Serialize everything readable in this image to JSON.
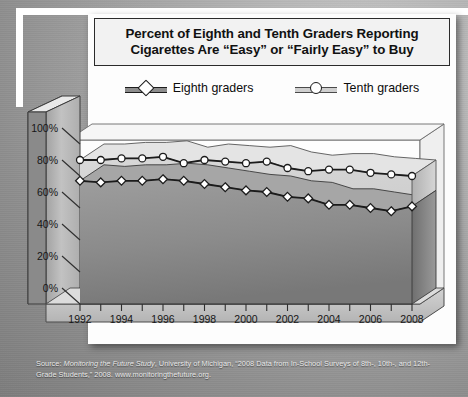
{
  "title": "Percent of Eighth and Tenth Graders Reporting Cigarettes Are “Easy” or “Fairly Easy” to Buy",
  "legend": {
    "eighth": "Eighth graders",
    "tenth": "Tenth graders"
  },
  "source": {
    "prefix": "Source: ",
    "italic": "Monitoring the Future Study",
    "rest": ", University of Michigan, “2008 Data from In-School Surveys of 8th-, 10th-, and 12th-Grade Students,” 2008. www.monitoringthefuture.org."
  },
  "colors": {
    "eighth_fill": "#8d8d8d",
    "tenth_fill": "#cfcfcf",
    "line": "#1b1b1b",
    "marker_fill": "#ffffff",
    "wall": "#b9b9b9",
    "floor": "#c4c4c4",
    "card": "#fdfdfd",
    "frame": "#ffffff",
    "background": "#9a9a9a"
  },
  "chart_data": {
    "type": "area",
    "title": "Percent of Eighth and Tenth Graders Reporting Cigarettes Are “Easy” or “Fairly Easy” to Buy",
    "xlabel": "",
    "ylabel": "",
    "ylim": [
      0,
      100
    ],
    "ytick_labels": [
      "0%",
      "20%",
      "40%",
      "60%",
      "80%",
      "100%"
    ],
    "ytick_values": [
      0,
      20,
      40,
      60,
      80,
      100
    ],
    "grid": false,
    "legend_position": "top",
    "x": [
      1992,
      1993,
      1994,
      1995,
      1996,
      1997,
      1998,
      1999,
      2000,
      2001,
      2002,
      2003,
      2004,
      2005,
      2006,
      2007,
      2008
    ],
    "xtick_labels": [
      "1992",
      "",
      "1994",
      "",
      "1996",
      "",
      "1998",
      "",
      "2000",
      "",
      "2002",
      "",
      "2004",
      "",
      "2006",
      "",
      "2008"
    ],
    "xtick_labels_shown": [
      "1992",
      "1994",
      "1996",
      "1998",
      "2000",
      "2002",
      "2004",
      "2006",
      "2008"
    ],
    "series": [
      {
        "name": "Tenth graders",
        "marker": "circle",
        "values": [
          90,
          90,
          91,
          91,
          92,
          88,
          90,
          89,
          88,
          89,
          85,
          83,
          84,
          84,
          82,
          81,
          80
        ]
      },
      {
        "name": "Eighth graders",
        "marker": "diamond",
        "values": [
          77,
          76,
          77,
          77,
          78,
          77,
          75,
          73,
          71,
          70,
          67,
          66,
          62,
          62,
          60,
          58,
          61
        ]
      }
    ]
  }
}
